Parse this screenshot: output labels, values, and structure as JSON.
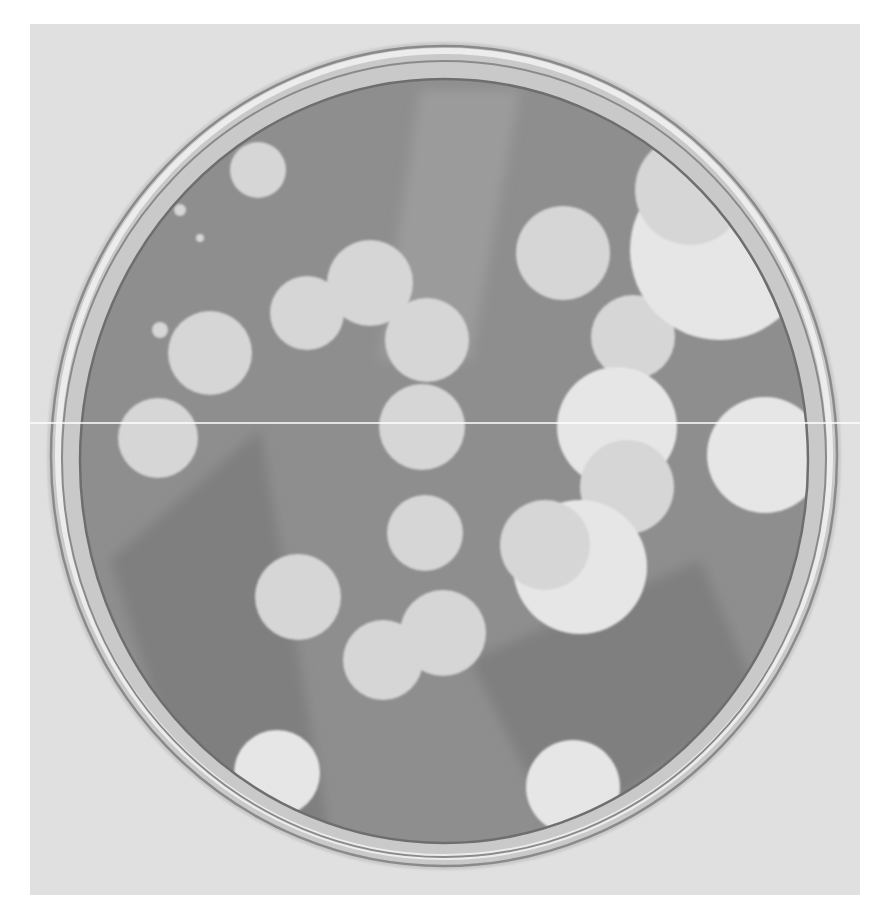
{
  "image": {
    "subject": "Petri dish with clear plaques on a bacterial lawn (grayscale photograph)",
    "canvas": {
      "width": 893,
      "height": 924,
      "background": "#ffffff"
    },
    "photo_frame": {
      "x": 30,
      "y": 24,
      "width": 830,
      "height": 871,
      "color": "#e0e0e0"
    },
    "scan_line": {
      "y": 423,
      "x1": 30,
      "x2": 860,
      "color": "#ffffff"
    },
    "colors": {
      "backdrop": "#e0e0e0",
      "rim_outer": "#c9c9c9",
      "rim_line": "#8a8a8a",
      "rim_highlight": "#ececec",
      "agar": "#8e8e8e",
      "agar_dark_band": "#7f7f7f",
      "agar_light_band": "#9b9b9b",
      "plaque": "#d6d6d6",
      "plaque_bright": "#e6e6e6"
    },
    "dish": {
      "outer_rim": {
        "cx": 444,
        "cy": 456,
        "rx": 397,
        "ry": 414
      },
      "inner_rim": {
        "cx": 444,
        "cy": 459,
        "rx": 382,
        "ry": 398
      },
      "agar": {
        "cx": 444,
        "cy": 461,
        "rx": 364,
        "ry": 382
      }
    },
    "plaques": [
      {
        "cx": 258,
        "cy": 170,
        "r": 28
      },
      {
        "cx": 200,
        "cy": 238,
        "r": 4
      },
      {
        "cx": 180,
        "cy": 210,
        "r": 6
      },
      {
        "cx": 160,
        "cy": 330,
        "r": 8
      },
      {
        "cx": 210,
        "cy": 353,
        "r": 42
      },
      {
        "cx": 158,
        "cy": 438,
        "r": 40
      },
      {
        "cx": 307,
        "cy": 313,
        "r": 37
      },
      {
        "cx": 370,
        "cy": 283,
        "r": 43
      },
      {
        "cx": 427,
        "cy": 340,
        "r": 42
      },
      {
        "cx": 422,
        "cy": 427,
        "r": 43
      },
      {
        "cx": 563,
        "cy": 253,
        "r": 47
      },
      {
        "cx": 633,
        "cy": 337,
        "r": 42
      },
      {
        "cx": 720,
        "cy": 250,
        "r": 90
      },
      {
        "cx": 690,
        "cy": 190,
        "r": 55
      },
      {
        "cx": 617,
        "cy": 427,
        "r": 60
      },
      {
        "cx": 627,
        "cy": 487,
        "r": 47
      },
      {
        "cx": 580,
        "cy": 567,
        "r": 67
      },
      {
        "cx": 545,
        "cy": 545,
        "r": 45
      },
      {
        "cx": 765,
        "cy": 455,
        "r": 58
      },
      {
        "cx": 425,
        "cy": 533,
        "r": 38
      },
      {
        "cx": 298,
        "cy": 597,
        "r": 43
      },
      {
        "cx": 383,
        "cy": 660,
        "r": 40
      },
      {
        "cx": 443,
        "cy": 633,
        "r": 43
      },
      {
        "cx": 277,
        "cy": 773,
        "r": 43
      },
      {
        "cx": 573,
        "cy": 787,
        "r": 47
      }
    ],
    "agar_bands": [
      {
        "points": "420,90 520,90 470,360 380,360",
        "tone": "light"
      },
      {
        "points": "110,560 260,430 330,840 200,840",
        "tone": "dark"
      },
      {
        "points": "470,660 700,560 760,700 560,840",
        "tone": "dark"
      }
    ]
  }
}
